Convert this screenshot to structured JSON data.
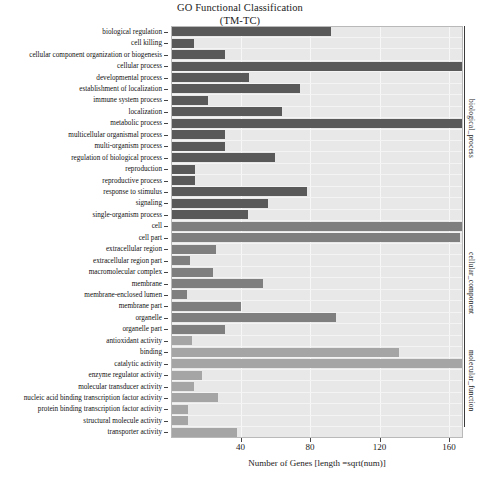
{
  "title": {
    "line1": "GO Functional Classification",
    "line2": "(TM-TC)"
  },
  "axis": {
    "x_label": "Number of Genes [length =sqrt(num)]",
    "x_ticks": [
      40,
      80,
      120,
      160
    ],
    "x_min": 0,
    "x_max": 168
  },
  "groups": [
    {
      "name": "biological_process",
      "start_index": 0,
      "end_index": 17
    },
    {
      "name": "cellular_component",
      "start_index": 18,
      "end_index": 26
    },
    {
      "name": "molecular_function",
      "start_index": 27,
      "end_index": 34
    }
  ],
  "colors": {
    "biological_process": "#595959",
    "cellular_component": "#7f7f7f",
    "molecular_function": "#a5a5a5",
    "panel_background": "#e8e8e8",
    "grid": "#f7f7f7"
  },
  "chart_data": {
    "type": "bar",
    "title": "GO Functional Classification (TM-TC)",
    "xlabel": "Number of Genes [length =sqrt(num)]",
    "ylabel": "",
    "orientation": "horizontal",
    "xlim": [
      0,
      168
    ],
    "grid": true,
    "legend": "right-side group brackets",
    "categories": [
      "biological regulation",
      "cell killing",
      "cellular component organization or biogenesis",
      "cellular process",
      "developmental process",
      "establishment of localization",
      "immune system process",
      "localization",
      "metabolic process",
      "multicellular organismal process",
      "multi-organism process",
      "regulation of biological process",
      "reproduction",
      "reproductive process",
      "response to stimulus",
      "signaling",
      "single-organism process",
      "cell",
      "cell part",
      "extracellular region",
      "extracellular region part",
      "macromolecular complex",
      "membrane",
      "membrane-enclosed lumen",
      "membrane part",
      "organelle",
      "organelle part",
      "antioxidant activity",
      "binding",
      "catalytic activity",
      "enzyme regulator activity",
      "molecular transducer activity",
      "nucleic acid binding transcription factor activity",
      "protein binding transcription factor activity",
      "structural molecule activity",
      "transporter activity"
    ],
    "values": [
      92,
      13,
      31,
      168,
      45,
      74,
      21,
      64,
      199,
      31,
      31,
      60,
      14,
      14,
      78,
      56,
      44,
      174,
      166,
      26,
      11,
      24,
      53,
      9,
      40,
      95,
      31,
      12,
      131,
      230,
      18,
      13,
      27,
      10,
      10,
      38
    ],
    "group_of": [
      "biological_process",
      "biological_process",
      "biological_process",
      "biological_process",
      "biological_process",
      "biological_process",
      "biological_process",
      "biological_process",
      "biological_process",
      "biological_process",
      "biological_process",
      "biological_process",
      "biological_process",
      "biological_process",
      "biological_process",
      "biological_process",
      "biological_process",
      "cellular_component",
      "cellular_component",
      "cellular_component",
      "cellular_component",
      "cellular_component",
      "cellular_component",
      "cellular_component",
      "cellular_component",
      "cellular_component",
      "cellular_component",
      "molecular_function",
      "molecular_function",
      "molecular_function",
      "molecular_function",
      "molecular_function",
      "molecular_function",
      "molecular_function",
      "molecular_function",
      "molecular_function"
    ]
  }
}
